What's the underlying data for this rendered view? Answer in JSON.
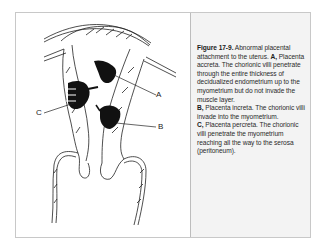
{
  "figure": {
    "number_label": "Figure 17-9.",
    "intro": " Abnormal placental attachment to the uterus. ",
    "items": [
      {
        "key": "A,",
        "text": " Placenta accreta. The chorionic villi penetrate through the entire thickness of decidualized endometrium up to the myometrium but do not invade the muscle layer."
      },
      {
        "key": "B,",
        "text": " Placenta increta. The chorionic villi invade into the myometrium."
      },
      {
        "key": "C,",
        "text": " Placenta percreta. The chorionic villi penetrate the myometrium reaching all the way to the serosa (peritoneum)."
      }
    ]
  },
  "diagram": {
    "labels": {
      "a": "A",
      "b": "B",
      "c": "C"
    }
  }
}
